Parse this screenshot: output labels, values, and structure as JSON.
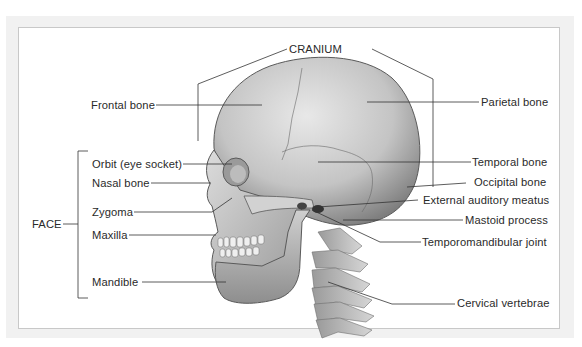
{
  "diagram": {
    "groups": {
      "cranium": "CRANIUM",
      "face": "FACE"
    },
    "left_labels": [
      {
        "id": "frontal",
        "text": "Frontal bone"
      },
      {
        "id": "orbit",
        "text": "Orbit (eye socket)"
      },
      {
        "id": "nasal",
        "text": "Nasal bone"
      },
      {
        "id": "zygoma",
        "text": "Zygoma"
      },
      {
        "id": "maxilla",
        "text": "Maxilla"
      },
      {
        "id": "mandible",
        "text": "Mandible"
      }
    ],
    "right_labels": [
      {
        "id": "parietal",
        "text": "Parietal bone"
      },
      {
        "id": "temporal",
        "text": "Temporal bone"
      },
      {
        "id": "occipital",
        "text": "Occipital bone"
      },
      {
        "id": "eam",
        "text": "External auditory meatus"
      },
      {
        "id": "mastoid",
        "text": "Mastoid process"
      },
      {
        "id": "tmj",
        "text": "Temporomandibular joint"
      },
      {
        "id": "cervical",
        "text": "Cervical vertebrae"
      }
    ],
    "colors": {
      "frame_bg": "#f1f1f1",
      "panel_bg": "#ffffff",
      "leader_line": "#333333",
      "bone_light": "#e6e6e6",
      "bone_mid": "#b9b9b9",
      "bone_dark": "#7d7d7d"
    }
  }
}
